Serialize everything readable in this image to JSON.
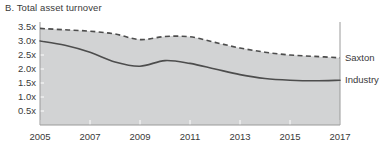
{
  "chart_data": {
    "type": "line",
    "title": "B. Total asset turnover",
    "xlabel": "",
    "ylabel": "",
    "xlim": [
      2005,
      2017
    ],
    "ylim": [
      0,
      3.75
    ],
    "grid": false,
    "legend_position": "right-inline",
    "x": [
      2005,
      2006,
      2007,
      2008,
      2009,
      2010,
      2011,
      2012,
      2013,
      2014,
      2015,
      2016,
      2017
    ],
    "y_tick_labels": [
      "3.5x",
      "3.0x",
      "2.5x",
      "2.0x",
      "1.5x",
      "1.0x",
      "0.5x"
    ],
    "y_tick_values": [
      3.5,
      3.0,
      2.5,
      2.0,
      1.5,
      1.0,
      0.5
    ],
    "x_tick_labels": [
      "2005",
      "2007",
      "2009",
      "2011",
      "2013",
      "2015",
      "2017"
    ],
    "x_tick_values": [
      2005,
      2007,
      2009,
      2011,
      2013,
      2015,
      2017
    ],
    "series": [
      {
        "name": "Saxton",
        "style": "dashed",
        "color": "#4d4d4d",
        "values": [
          3.45,
          3.4,
          3.35,
          3.25,
          3.05,
          3.16,
          3.15,
          2.95,
          2.75,
          2.6,
          2.5,
          2.45,
          2.4
        ]
      },
      {
        "name": "Industry",
        "style": "solid",
        "color": "#4d4d4d",
        "values": [
          3.0,
          2.85,
          2.6,
          2.25,
          2.1,
          2.3,
          2.2,
          2.0,
          1.8,
          1.66,
          1.6,
          1.58,
          1.6
        ]
      }
    ],
    "area_fill_color": "#d2d3d4",
    "area_fill_series": "Saxton"
  },
  "chart": {
    "title": "B. Total asset turnover",
    "legend": {
      "saxton_label": "Saxton",
      "industry_label": "Industry"
    }
  }
}
